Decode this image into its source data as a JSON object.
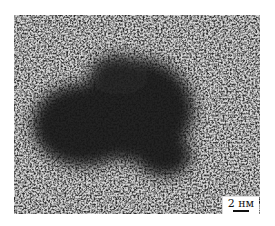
{
  "figure": {
    "scale_bar": {
      "label": "2 нм",
      "value": 2,
      "unit": "нм"
    },
    "colors": {
      "background_light": "#d8d8d8",
      "background_dark": "#3a3a3a",
      "particle": "#1a1a1a"
    }
  }
}
